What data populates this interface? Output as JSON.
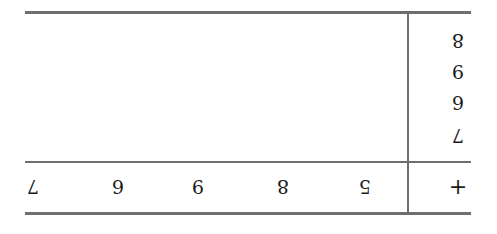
{
  "table": {
    "operator": "+",
    "column_headers": [
      "5",
      "8",
      "9",
      "6",
      "7"
    ],
    "row_headers": [
      "7",
      "6",
      "9",
      "8"
    ],
    "orientation": "rotated 180 degrees"
  }
}
